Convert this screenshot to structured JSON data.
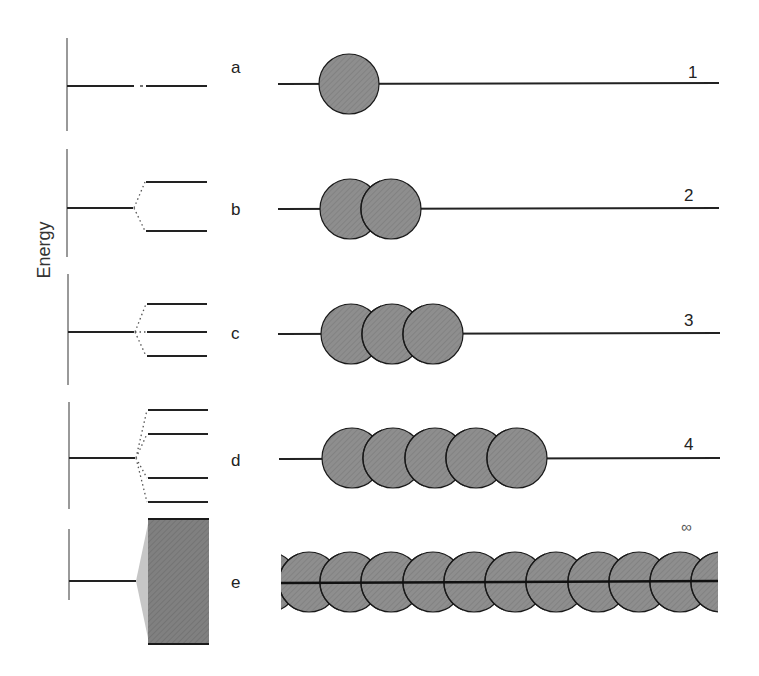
{
  "diagram": {
    "axis_label": "Energy",
    "colors": {
      "line": "#222222",
      "atom_fill": "#8c8c8c",
      "atom_stroke": "#1a1a1a",
      "band_fill": "#7d7d7d",
      "band_taper": "#c4c4c4"
    },
    "rows": [
      {
        "label": "a",
        "atom_count_label": "1",
        "circles": 1,
        "energy_levels": 1,
        "description": "single atom, single energy level"
      },
      {
        "label": "b",
        "atom_count_label": "2",
        "circles": 2,
        "energy_levels": 2,
        "description": "two overlapping atoms, level splits into 2"
      },
      {
        "label": "c",
        "atom_count_label": "3",
        "circles": 3,
        "energy_levels": 3,
        "description": "three overlapping atoms, level splits into 3"
      },
      {
        "label": "d",
        "atom_count_label": "4",
        "circles": 5,
        "energy_levels": 5,
        "description": "chain of atoms, level splits into several"
      },
      {
        "label": "e",
        "atom_count_label": "∞",
        "circles": 11,
        "energy_levels": "band",
        "description": "infinite chain, levels merge into a continuous band"
      }
    ]
  }
}
